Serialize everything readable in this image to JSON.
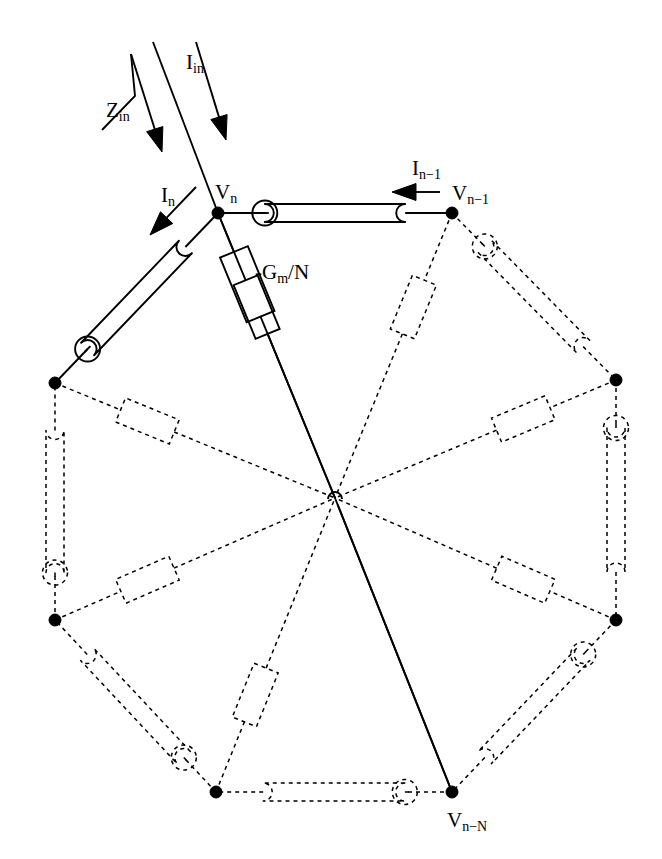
{
  "figure": {
    "type": "circuit-schematic",
    "background_color": "#ffffff",
    "line_color": "#000000",
    "solid_stroke_width": 1.9,
    "dashed_stroke_width": 1.5,
    "dash_pattern": "4 4",
    "node_dot_radius": 6,
    "center": {
      "x": 335,
      "y": 498
    },
    "ring_sides": 8
  },
  "labels": {
    "z_in": {
      "base": "Z",
      "sub": "in",
      "x": 106,
      "y": 100
    },
    "i_in": {
      "base": "I",
      "sub": "in",
      "x": 186,
      "y": 52
    },
    "i_n": {
      "base": "I",
      "sub": "n",
      "x": 161,
      "y": 185
    },
    "v_n": {
      "base": "V",
      "sub": "n",
      "x": 215,
      "y": 182
    },
    "i_nm1": {
      "base": "I",
      "sub": "n−1",
      "x": 412,
      "y": 158
    },
    "v_nm1": {
      "base": "V",
      "sub": "n−1",
      "x": 452,
      "y": 183
    },
    "gm": {
      "base": "-G",
      "sub": "m",
      "tail": "/N",
      "x": 255,
      "y": 262
    },
    "v_nmN": {
      "base": "V",
      "sub": "n−N",
      "x": 447,
      "y": 810
    }
  },
  "nodes": [
    {
      "name": "node-v-n",
      "x": 218,
      "y": 213,
      "label": "V_n",
      "highlighted": true
    },
    {
      "name": "node-v-nm1",
      "x": 452,
      "y": 213,
      "label": "V_n-1",
      "highlighted": true
    },
    {
      "name": "node-right-top",
      "x": 616,
      "y": 380,
      "label": "",
      "highlighted": true
    },
    {
      "name": "node-right-bottom",
      "x": 616,
      "y": 620,
      "label": "",
      "highlighted": true
    },
    {
      "name": "node-v-nmN",
      "x": 452,
      "y": 792,
      "label": "V_n-N",
      "highlighted": true
    },
    {
      "name": "node-bottom-left",
      "x": 216,
      "y": 792,
      "label": "",
      "highlighted": true
    },
    {
      "name": "node-left-bottom",
      "x": 55,
      "y": 620,
      "label": "",
      "highlighted": true
    },
    {
      "name": "node-left-top",
      "x": 55,
      "y": 383,
      "label": "",
      "highlighted": true
    }
  ],
  "ring_edges": [
    {
      "name": "edge-vn-vnm1",
      "from": 0,
      "to": 1,
      "style": "solid",
      "element": "inductor",
      "circle_at": "from"
    },
    {
      "name": "edge-vnm1-righttop",
      "from": 1,
      "to": 2,
      "style": "dashed",
      "element": "inductor",
      "circle_at": "from"
    },
    {
      "name": "edge-righttop-rightbottom",
      "from": 2,
      "to": 3,
      "style": "dashed",
      "element": "inductor",
      "circle_at": "from"
    },
    {
      "name": "edge-rightbottom-vnmN",
      "from": 3,
      "to": 4,
      "style": "dashed",
      "element": "inductor",
      "circle_at": "from"
    },
    {
      "name": "edge-vnmN-bottomleft",
      "from": 4,
      "to": 5,
      "style": "dashed",
      "element": "inductor",
      "circle_at": "from"
    },
    {
      "name": "edge-bottomleft-leftbottom",
      "from": 5,
      "to": 6,
      "style": "dashed",
      "element": "inductor",
      "circle_at": "from"
    },
    {
      "name": "edge-leftbottom-lefttop",
      "from": 6,
      "to": 7,
      "style": "dashed",
      "element": "inductor",
      "circle_at": "from"
    },
    {
      "name": "edge-lefttop-vn",
      "from": 7,
      "to": 0,
      "style": "solid",
      "element": "inductor",
      "circle_at": "from"
    }
  ],
  "spokes": [
    {
      "name": "spoke-vn-center",
      "from": 0,
      "style": "solid",
      "element": "resistor",
      "label": "-Gm/N"
    },
    {
      "name": "spoke-vnm1-center",
      "from": 1,
      "style": "dashed",
      "element": "resistor",
      "label": ""
    },
    {
      "name": "spoke-righttop-center",
      "from": 2,
      "style": "dashed",
      "element": "resistor",
      "label": ""
    },
    {
      "name": "spoke-rightbottom-center",
      "from": 3,
      "style": "dashed",
      "element": "resistor",
      "label": ""
    },
    {
      "name": "spoke-vnmN-center",
      "from": 4,
      "style": "solid",
      "element": "none",
      "label": ""
    },
    {
      "name": "spoke-bottomleft-center",
      "from": 5,
      "style": "dashed",
      "element": "resistor",
      "label": ""
    },
    {
      "name": "spoke-leftbottom-center",
      "from": 6,
      "style": "dashed",
      "element": "resistor",
      "label": ""
    },
    {
      "name": "spoke-lefttop-center",
      "from": 7,
      "style": "dashed",
      "element": "resistor",
      "label": ""
    }
  ],
  "arrows": [
    {
      "name": "arrow-i-in",
      "x1": 196,
      "y1": 42,
      "x2": 226,
      "y2": 140,
      "style": "solid-filled"
    },
    {
      "name": "arrow-z-in",
      "x1": 131,
      "y1": 54,
      "x2": 162,
      "y2": 152,
      "style": "solid-filled",
      "has_elbow": true
    },
    {
      "name": "arrow-i-n",
      "x1": 196,
      "y1": 187,
      "x2": 150,
      "y2": 235,
      "style": "solid-filled"
    },
    {
      "name": "arrow-i-nm1",
      "x1": 440,
      "y1": 192,
      "x2": 392,
      "y2": 192,
      "style": "solid-filled"
    }
  ],
  "input_line": {
    "x1": 153,
    "y1": 42,
    "x2": 218,
    "y2": 213
  }
}
